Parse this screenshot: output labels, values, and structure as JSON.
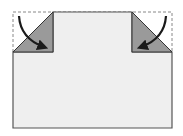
{
  "diagram": {
    "title": "",
    "type": "origami-fold",
    "colors": {
      "paper": "#efefef",
      "paper_edge": "#555555",
      "folded_flap": "#9a9a9a",
      "dashed_outline": "#888888",
      "arrow": "#1a1a1a"
    },
    "steps": [
      {
        "id": "fold-left-corner",
        "direction": "down-right",
        "icon": "curved-arrow"
      },
      {
        "id": "fold-right-corner",
        "direction": "down-left",
        "icon": "curved-arrow"
      }
    ]
  }
}
